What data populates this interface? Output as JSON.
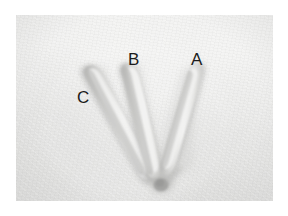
{
  "figure": {
    "type": "photograph",
    "orientation": "landscape",
    "plate_background_color": "#eeeeed",
    "page_background_color": "#ffffff",
    "label_color": "#1b1b1b"
  },
  "labels": [
    {
      "id": "A",
      "text": "A",
      "toe": "right-toe",
      "x": 175,
      "y": 36
    },
    {
      "id": "B",
      "text": "B",
      "toe": "middle-toe",
      "x": 112,
      "y": 36
    },
    {
      "id": "C",
      "text": "C",
      "toe": "left-toe",
      "x": 61,
      "y": 74
    }
  ],
  "track": {
    "digit_count": 3,
    "convergence_point": {
      "x": 145,
      "y": 172
    },
    "toes": [
      {
        "label": "A",
        "name": "right-toe",
        "tip": {
          "x": 191,
          "y": 58
        }
      },
      {
        "label": "B",
        "name": "middle-toe",
        "tip": {
          "x": 125,
          "y": 55
        }
      },
      {
        "label": "C",
        "name": "left-toe",
        "tip": {
          "x": 87,
          "y": 68
        }
      }
    ]
  }
}
